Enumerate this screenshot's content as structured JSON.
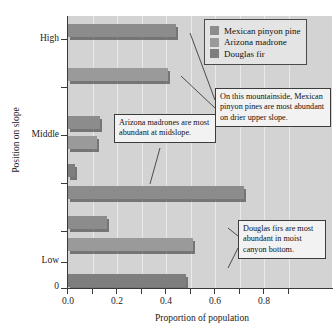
{
  "chart_data": {
    "type": "bar",
    "orientation": "horizontal",
    "title": "",
    "xlabel": "Proportion of population",
    "ylabel": "Position on slope",
    "xlim": [
      0.0,
      0.92
    ],
    "xticks": [
      0.0,
      0.2,
      0.4,
      0.6,
      0.8
    ],
    "xticklabels": [
      "0.0",
      "0.2",
      "0.4",
      "0.6",
      "0.8"
    ],
    "xminorticks": [
      0.1,
      0.3,
      0.5,
      0.7
    ],
    "categories": [
      "High",
      "Middle",
      "Low"
    ],
    "yticklabels": [
      "High",
      "Middle",
      "Low",
      "0"
    ],
    "grid": "vertical",
    "legend_position": "top-right",
    "series": [
      {
        "name": "Mexican pinyon pine",
        "color": "#8c8c8c",
        "values": [
          0.44,
          0.13,
          0.16
        ]
      },
      {
        "name": "Arizona madrone",
        "color": "#9a9a9a",
        "values": [
          0.41,
          0.12,
          0.51
        ]
      },
      {
        "name": "Douglas fir",
        "color": "#7e7e7e",
        "values": [
          0.0,
          0.03,
          0.48
        ]
      }
    ],
    "extra_bars": [
      {
        "group": "Middle",
        "series": "Douglas fir",
        "value": 0.72
      }
    ],
    "annotations": [
      {
        "id": "pinyon",
        "text": "On this mountainside, Mexican pinyon pines are most abundant on drier upper slope."
      },
      {
        "id": "madrone",
        "text": "Arizona madrones are most abundant at midslope."
      },
      {
        "id": "fir",
        "text": "Douglas firs are most abundant in moist canyon bottom."
      }
    ]
  },
  "axes": {
    "x_title": "Proportion of population",
    "y_title": "Position on slope",
    "x_tick_labels": [
      "0.0",
      "0.2",
      "0.4",
      "0.6",
      "0.8"
    ],
    "y_tick_labels": [
      "High",
      "Middle",
      "Low",
      "0"
    ]
  },
  "legend": {
    "items": [
      {
        "label": "Mexican pinyon pine",
        "color": "#8c8c8c"
      },
      {
        "label": "Arizona madrone",
        "color": "#9a9a9a"
      },
      {
        "label": "Douglas fir",
        "color": "#7e7e7e"
      }
    ]
  },
  "callouts": {
    "pinyon": "On this mountainside, Mexican pinyon pines are most abundant on drier upper slope.",
    "madrone": "Arizona madrones are most abundant at midslope.",
    "fir": "Douglas firs are most abundant in moist canyon bottom."
  },
  "bars": [
    {
      "name": "bar-high-pinyon",
      "group": "High",
      "series": "Mexican pinyon pine",
      "value": 0.44,
      "color": "#8c8c8c",
      "top": 8,
      "left": 0
    },
    {
      "name": "bar-high-madrone",
      "group": "High",
      "series": "Arizona madrone",
      "value": 0.41,
      "color": "#9a9a9a",
      "top": 52,
      "left": 0
    },
    {
      "name": "bar-mid-pinyon",
      "group": "Middle",
      "series": "Mexican pinyon pine",
      "value": 0.13,
      "color": "#8c8c8c",
      "top": 100,
      "left": 0
    },
    {
      "name": "bar-mid-madrone",
      "group": "Middle",
      "series": "Arizona madrone",
      "value": 0.12,
      "color": "#9a9a9a",
      "top": 120,
      "left": 0
    },
    {
      "name": "bar-mid-fir-small",
      "group": "Middle",
      "series": "Douglas fir",
      "value": 0.03,
      "color": "#7e7e7e",
      "top": 148,
      "left": 0
    },
    {
      "name": "bar-mid-fir-long",
      "group": "Middle",
      "series": "Douglas fir",
      "value": 0.72,
      "color": "#8c8c8c",
      "top": 170,
      "left": 0
    },
    {
      "name": "bar-low-pinyon",
      "group": "Low",
      "series": "Mexican pinyon pine",
      "value": 0.16,
      "color": "#8c8c8c",
      "top": 200,
      "left": 0
    },
    {
      "name": "bar-low-madrone",
      "group": "Low",
      "series": "Arizona madrone",
      "value": 0.51,
      "color": "#9a9a9a",
      "top": 222,
      "left": 0
    },
    {
      "name": "bar-low-fir",
      "group": "Low",
      "series": "Douglas fir",
      "value": 0.48,
      "color": "#7e7e7e",
      "top": 258,
      "left": 0
    }
  ],
  "geometry": {
    "plot_left": 68,
    "plot_top": 16,
    "plot_width": 264,
    "plot_height": 272,
    "x_px_per_unit": 245,
    "y_tick_tops": [
      39,
      87,
      135,
      183,
      231,
      262,
      288
    ],
    "y_label_tops": [
      33,
      129,
      255,
      281
    ]
  }
}
